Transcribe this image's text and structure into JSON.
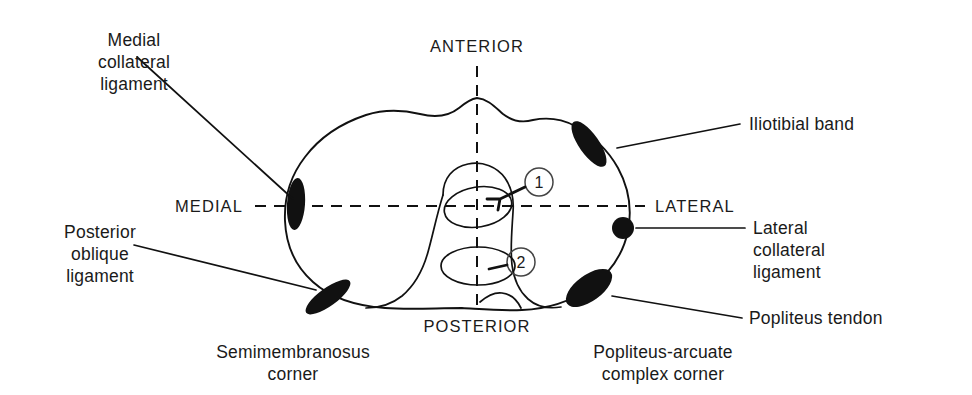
{
  "figure": {
    "background_color": "#ffffff",
    "ink_color": "#111111"
  },
  "orientation_labels": {
    "anterior": "ANTERIOR",
    "posterior": "POSTERIOR",
    "medial": "MEDIAL",
    "lateral": "LATERAL"
  },
  "structures": [
    {
      "id": "medial-collateral-ligament",
      "label": "Medial\ncollateral\nligament",
      "label_lines": [
        "Medial",
        "collateral",
        "ligament"
      ],
      "side": "medial",
      "marker_shape": "ellipse",
      "marker_color": "#111111"
    },
    {
      "id": "posterior-oblique-ligament",
      "label": "Posterior\noblique\nligament",
      "label_lines": [
        "Posterior",
        "oblique",
        "ligament"
      ],
      "side": "medial",
      "marker_shape": "ellipse",
      "marker_color": "#111111"
    },
    {
      "id": "semimembranosus-corner",
      "label": "Semimembranosus\ncorner",
      "label_lines": [
        "Semimembranosus",
        "corner"
      ],
      "side": "posteromedial",
      "marker_shape": "ellipse",
      "marker_color": "#111111"
    },
    {
      "id": "iliotibial-band",
      "label": "Iliotibial band",
      "label_lines": [
        "Iliotibial band"
      ],
      "side": "lateral",
      "marker_shape": "ellipse",
      "marker_color": "#111111"
    },
    {
      "id": "lateral-collateral-ligament",
      "label": "Lateral\ncollateral\nligament",
      "label_lines": [
        "Lateral",
        "collateral",
        "ligament"
      ],
      "side": "lateral",
      "marker_shape": "circle",
      "marker_color": "#111111"
    },
    {
      "id": "popliteus-tendon",
      "label": "Popliteus tendon",
      "label_lines": [
        "Popliteus tendon"
      ],
      "side": "lateral",
      "marker_shape": "ellipse",
      "marker_color": "#111111"
    },
    {
      "id": "popliteus-arcuate-complex-corner",
      "label": "Popliteus-arcuate\ncomplex corner",
      "label_lines": [
        "Popliteus-arcuate",
        "complex corner"
      ],
      "side": "posterolateral",
      "marker_shape": "ellipse",
      "marker_color": "#111111"
    }
  ],
  "callouts": [
    {
      "id": "callout-1",
      "number": "1"
    },
    {
      "id": "callout-2",
      "number": "2"
    }
  ]
}
